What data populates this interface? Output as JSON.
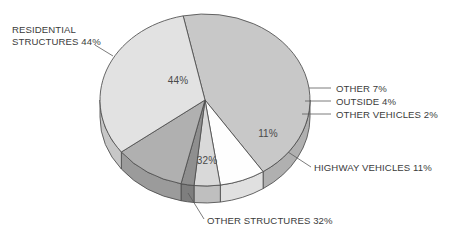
{
  "chart_data": {
    "type": "pie",
    "title": "",
    "subtitle": "",
    "xlabel": "",
    "ylabel": "",
    "legend_position": "none",
    "grid": false,
    "style": "3d-pie",
    "units": "percent",
    "total": 100,
    "categories": [
      "RESIDENTIAL STRUCTURES",
      "OTHER",
      "OUTSIDE",
      "OTHER VEHICLES",
      "HIGHWAY VEHICLES",
      "OTHER STRUCTURES"
    ],
    "values": [
      44,
      7,
      4,
      2,
      11,
      32
    ],
    "slices": [
      {
        "name": "residential-structures",
        "label": "RESIDENTIAL STRUCTURES 44%",
        "callout_line1": "RESIDENTIAL",
        "callout_line2": "STRUCTURES 44%",
        "inner_value": "44%",
        "value": 44,
        "color": "#c8c8c8"
      },
      {
        "name": "other",
        "label": "OTHER 7%",
        "callout_line1": "OTHER 7%",
        "callout_line2": "",
        "inner_value": "",
        "value": 7,
        "color": "#fefefe"
      },
      {
        "name": "outside",
        "label": "OUTSIDE 4%",
        "callout_line1": "OUTSIDE 4%",
        "callout_line2": "",
        "inner_value": "",
        "value": 4,
        "color": "#d9d9d9"
      },
      {
        "name": "other-vehicles",
        "label": "OTHER VEHICLES 2%",
        "callout_line1": "OTHER VEHICLES 2%",
        "callout_line2": "",
        "inner_value": "",
        "value": 2,
        "color": "#8f8f8f"
      },
      {
        "name": "highway-vehicles",
        "label": "HIGHWAY VEHICLES 11%",
        "callout_line1": "HIGHWAY VEHICLES 11%",
        "callout_line2": "",
        "inner_value": "11%",
        "value": 11,
        "color": "#b0b0b0"
      },
      {
        "name": "other-structures",
        "label": "OTHER STRUCTURES 32%",
        "callout_line1": "OTHER STRUCTURES 32%",
        "callout_line2": "",
        "inner_value": "32%",
        "value": 32,
        "color": "#e2e2e2"
      }
    ],
    "colors": {
      "background": "#ffffff",
      "outline": "#4d4d4d",
      "text": "#3b3b3b",
      "leader": "#5a5a5a"
    }
  }
}
